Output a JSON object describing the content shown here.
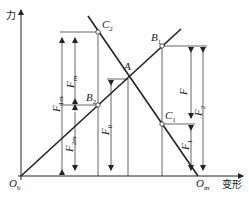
{
  "diagram": {
    "type": "force-deformation diagram (bolted joint)",
    "axes": {
      "y_label": "力",
      "x_label": "变形"
    },
    "points": {
      "origin_bolt": {
        "main": "O",
        "sub": "b"
      },
      "origin_member": {
        "main": "O",
        "sub": "m"
      },
      "A": {
        "main": "A",
        "sub": ""
      },
      "B1": {
        "main": "B",
        "sub": "1"
      },
      "B2": {
        "main": "B",
        "sub": "2"
      },
      "C1": {
        "main": "C",
        "sub": "1"
      },
      "C2": {
        "main": "C",
        "sub": "2"
      }
    },
    "forces": {
      "F": {
        "main": "F",
        "sub": ""
      },
      "F0": {
        "main": "F",
        "sub": "0"
      },
      "F1": {
        "main": "F",
        "sub": "1"
      },
      "F2": {
        "main": "F",
        "sub": "2"
      },
      "Fm": {
        "main": "F",
        "sub": "m"
      },
      "F1m": {
        "main": "F",
        "sub": "1m"
      },
      "F2m": {
        "main": "F",
        "sub": "2m"
      }
    },
    "colors": {
      "line": "#222222",
      "background": "#ffffff"
    }
  }
}
